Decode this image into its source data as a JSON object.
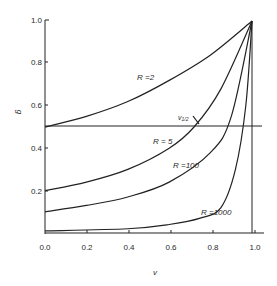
{
  "chart_data": {
    "type": "line",
    "title": "",
    "xlabel": "v",
    "ylabel": "g",
    "xlim": [
      0.0,
      1.0
    ],
    "ylim": [
      0.0,
      1.0
    ],
    "x_ticks": [
      "0.0",
      "0.2",
      "0.4",
      "0.6",
      "0.8",
      "1.0"
    ],
    "y_ticks": [
      "0.2",
      "0.4",
      "0.6",
      "0.8",
      "1.0"
    ],
    "grid": false,
    "legend": "inline labels",
    "reference_line": {
      "y": 0.5,
      "label": "v1/2"
    },
    "series": [
      {
        "name": "R = 2",
        "label": "R =2",
        "points": [
          [
            0,
            0.5
          ],
          [
            0.2,
            0.55
          ],
          [
            0.4,
            0.62
          ],
          [
            0.6,
            0.72
          ],
          [
            0.8,
            0.84
          ],
          [
            1.0,
            1.0
          ]
        ]
      },
      {
        "name": "R = 5",
        "label": "R = 5",
        "points": [
          [
            0,
            0.2
          ],
          [
            0.2,
            0.24
          ],
          [
            0.4,
            0.3
          ],
          [
            0.6,
            0.4
          ],
          [
            0.72,
            0.5
          ],
          [
            0.85,
            0.68
          ],
          [
            1.0,
            1.0
          ]
        ]
      },
      {
        "name": "R = 100",
        "label": "R =100",
        "points": [
          [
            0,
            0.1
          ],
          [
            0.2,
            0.13
          ],
          [
            0.4,
            0.17
          ],
          [
            0.6,
            0.24
          ],
          [
            0.8,
            0.38
          ],
          [
            0.9,
            0.55
          ],
          [
            1.0,
            1.0
          ]
        ]
      },
      {
        "name": "R = 1000",
        "label": "R =1000",
        "points": [
          [
            0,
            0.01
          ],
          [
            0.4,
            0.02
          ],
          [
            0.6,
            0.04
          ],
          [
            0.75,
            0.07
          ],
          [
            0.85,
            0.12
          ],
          [
            0.92,
            0.3
          ],
          [
            0.97,
            0.6
          ],
          [
            1.0,
            1.0
          ]
        ]
      }
    ]
  }
}
